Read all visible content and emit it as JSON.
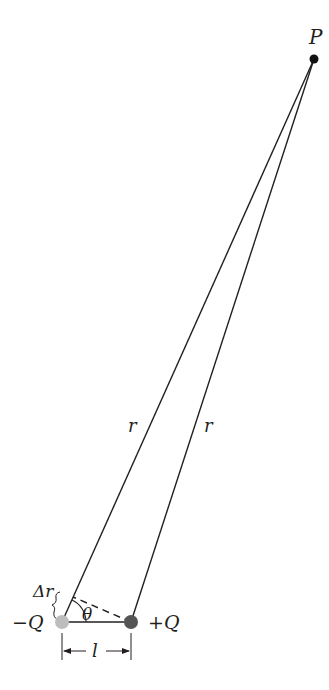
{
  "diagram": {
    "point": {
      "label": "P"
    },
    "distance_labels": {
      "left": "r",
      "right": "r"
    },
    "path_difference_label": "Δr",
    "angle_label": "θ",
    "separation_label": "l",
    "charges": {
      "negative": {
        "label": "−Q",
        "color": "#bdbdbd"
      },
      "positive": {
        "label": "+Q",
        "color": "#555555"
      }
    },
    "colors": {
      "line": "#231f20",
      "background": "#ffffff"
    }
  }
}
